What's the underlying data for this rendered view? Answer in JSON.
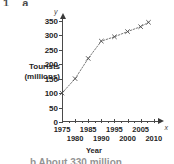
{
  "page": {
    "cropped_question_label": "1  a",
    "cropped_answer_text": "b  About 330 million"
  },
  "chart_data": {
    "type": "line",
    "title": "",
    "xlabel": "Year",
    "ylabel": "Tourists (millions)",
    "x_axis_letter": "x",
    "y_axis_letter": "y",
    "grid": false,
    "legend": "none",
    "marker": "x",
    "line_style": "dashed",
    "xlim": [
      1975,
      2012
    ],
    "ylim": [
      0,
      360
    ],
    "ytick_labels": [
      "0",
      "50",
      "100",
      "150",
      "200",
      "250",
      "300",
      "350"
    ],
    "ytick_values": [
      0,
      50,
      100,
      150,
      200,
      250,
      300,
      350
    ],
    "xtick_labels": [
      "1975",
      "1980",
      "1985",
      "1990",
      "1995",
      "2000",
      "2005",
      "2010"
    ],
    "xtick_values": [
      1975,
      1980,
      1985,
      1990,
      1995,
      2000,
      2005,
      2010
    ],
    "x": [
      1975,
      1980,
      1985,
      1990,
      1995,
      2000,
      2005,
      2008
    ],
    "values": [
      100,
      150,
      220,
      280,
      295,
      313,
      330,
      345
    ],
    "series": [
      {
        "name": "International tourist arrivals",
        "x": [
          1975,
          1980,
          1985,
          1990,
          1995,
          2000,
          2005,
          2008
        ],
        "values": [
          100,
          150,
          220,
          280,
          295,
          313,
          330,
          345
        ]
      }
    ]
  }
}
